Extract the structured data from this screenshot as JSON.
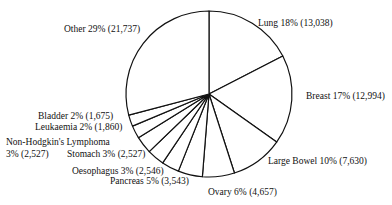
{
  "chart_data": {
    "type": "pie",
    "title": "",
    "slices": [
      {
        "label": "Lung",
        "percent": 18,
        "count": 13038,
        "text": "Lung 18% (13,038)"
      },
      {
        "label": "Breast",
        "percent": 17,
        "count": 12994,
        "text": "Breast 17% (12,994)"
      },
      {
        "label": "Large Bowel",
        "percent": 10,
        "count": 7630,
        "text": "Large Bowel 10% (7,630)"
      },
      {
        "label": "Ovary",
        "percent": 6,
        "count": 4657,
        "text": "Ovary 6% (4,657)"
      },
      {
        "label": "Pancreas",
        "percent": 5,
        "count": 3543,
        "text": "Pancreas 5% (3,543)"
      },
      {
        "label": "Oesophagus",
        "percent": 3,
        "count": 2546,
        "text": "Oesophagus 3% (2,546)"
      },
      {
        "label": "Stomach",
        "percent": 3,
        "count": 2527,
        "text": "Stomach 3% (2,527)"
      },
      {
        "label": "Non-Hodgkin's Lymphoma",
        "percent": 3,
        "count": 2527,
        "text": "Non-Hodgkin's Lymphoma",
        "text2": "3% (2,527)"
      },
      {
        "label": "Leukaemia",
        "percent": 2,
        "count": 1860,
        "text": "Leukaemia 2% (1,860)"
      },
      {
        "label": "Bladder",
        "percent": 2,
        "count": 1675,
        "text": "Bladder 2% (1,675)"
      },
      {
        "label": "Other",
        "percent": 29,
        "count": 21737,
        "text": "Other 29% (21,737)"
      }
    ],
    "colors": {
      "fill": "#ffffff",
      "stroke": "#111111"
    },
    "legend": "none (direct labels)"
  }
}
